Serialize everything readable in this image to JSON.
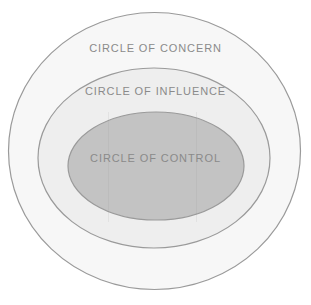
{
  "canvas": {
    "width": 311,
    "height": 305,
    "background": "#ffffff"
  },
  "diagram": {
    "type": "concentric-circles",
    "title_text_color": "#8a8a8a",
    "stroke_color": "#9a9a9a",
    "rings": [
      {
        "id": "concern",
        "label": "CIRCLE OF CONCERN",
        "level": 1,
        "fill": "#f7f7f7",
        "stroke": "#9a9a9a",
        "stroke_width": 1.2,
        "cx": 154.5,
        "cy": 151,
        "rx": 146.5,
        "ry": 139
      },
      {
        "id": "influence",
        "label": "CIRCLE OF INFLUENCE",
        "level": 2,
        "fill": "#eeeeee",
        "stroke": "#9a9a9a",
        "stroke_width": 1.2,
        "cx": 154,
        "cy": 158,
        "rx": 116,
        "ry": 90
      },
      {
        "id": "control",
        "label": "CIRCLE OF CONTROL",
        "level": 3,
        "fill": "#c3c3c3",
        "stroke": "#9a9a9a",
        "stroke_width": 1.2,
        "cx": 156,
        "cy": 166,
        "rx": 88,
        "ry": 54
      }
    ]
  }
}
